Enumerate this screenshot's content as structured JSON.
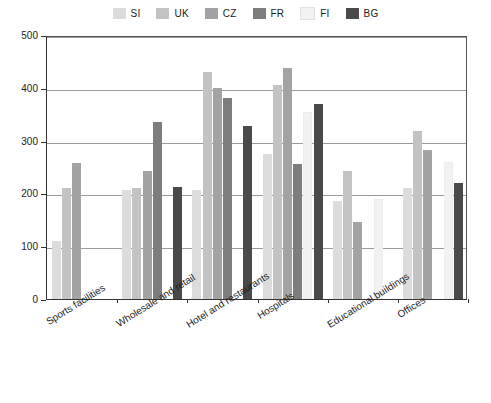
{
  "legend": {
    "position": "top-center",
    "entries": [
      {
        "label": "SI",
        "color": "#dcdcdc"
      },
      {
        "label": "UK",
        "color": "#c3c3c3"
      },
      {
        "label": "CZ",
        "color": "#a3a3a3"
      },
      {
        "label": "FR",
        "color": "#7d7d7d"
      },
      {
        "label": "FI",
        "color": "#f2f2f2"
      },
      {
        "label": "BG",
        "color": "#4a4a4a"
      }
    ]
  },
  "axes": {
    "y_ticks": [
      "0",
      "100",
      "200",
      "300",
      "400",
      "500"
    ],
    "y_min": 0,
    "y_max": 500,
    "x_categories": [
      "Sports facilities",
      "Wholesale and retail",
      "Hotel and restaurants",
      "Hospitals",
      "Educational buildings",
      "Offices"
    ]
  },
  "caption": {
    "text": ""
  },
  "chart_data": {
    "type": "bar",
    "title": "",
    "subtitle": "",
    "xlabel": "",
    "ylabel": "",
    "ylim": [
      0,
      500
    ],
    "grid": true,
    "legend_position": "top-center",
    "categories": [
      "Sports facilities",
      "Wholesale and retail",
      "Hotel and restaurants",
      "Hospitals",
      "Educational buildings",
      "Offices"
    ],
    "series": [
      {
        "name": "SI",
        "color": "#dcdcdc",
        "values": [
          110,
          207,
          207,
          275,
          186,
          210
        ]
      },
      {
        "name": "UK",
        "color": "#c3c3c3",
        "values": [
          210,
          210,
          430,
          405,
          243,
          318
        ]
      },
      {
        "name": "CZ",
        "color": "#a3a3a3",
        "values": [
          258,
          243,
          400,
          437,
          145,
          283
        ]
      },
      {
        "name": "FR",
        "color": "#7d7d7d",
        "values": [
          null,
          335,
          380,
          255,
          null,
          null
        ]
      },
      {
        "name": "FI",
        "color": "#f2f2f2",
        "values": [
          null,
          null,
          null,
          355,
          190,
          260
        ]
      },
      {
        "name": "BG",
        "color": "#4a4a4a",
        "values": [
          null,
          212,
          327,
          370,
          null,
          220
        ]
      }
    ]
  }
}
